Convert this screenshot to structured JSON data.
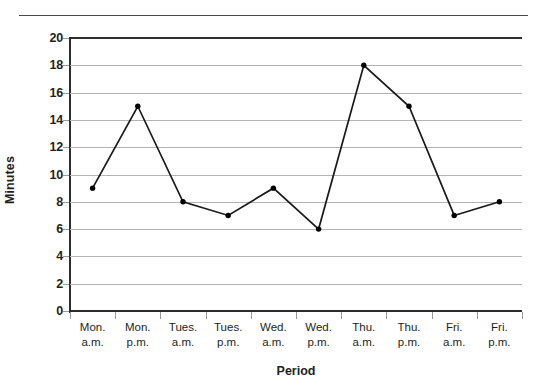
{
  "figure": {
    "top_rule": "decorative-rule"
  },
  "chart_data": {
    "type": "line",
    "title": "",
    "subtitle": "",
    "xlabel": "Period",
    "ylabel": "Minutes",
    "categories": [
      "Mon. a.m.",
      "Mon. p.m.",
      "Tues. a.m.",
      "Tues. p.m.",
      "Wed. a.m.",
      "Wed. p.m.",
      "Thu. a.m.",
      "Thu. p.m.",
      "Fri. a.m.",
      "Fri. p.m."
    ],
    "category_lines": [
      [
        "Mon.",
        "a.m."
      ],
      [
        "Mon.",
        "p.m."
      ],
      [
        "Tues.",
        "a.m."
      ],
      [
        "Tues.",
        "p.m."
      ],
      [
        "Wed.",
        "a.m."
      ],
      [
        "Wed.",
        "p.m."
      ],
      [
        "Thu.",
        "a.m."
      ],
      [
        "Thu.",
        "p.m."
      ],
      [
        "Fri.",
        "a.m."
      ],
      [
        "Fri.",
        "p.m."
      ]
    ],
    "values": [
      9,
      15,
      8,
      7,
      9,
      6,
      18,
      15,
      7,
      8
    ],
    "ylim": [
      0,
      20
    ],
    "ytick_labels": [
      "20",
      "18",
      "16",
      "14",
      "12",
      "10",
      "8",
      "6",
      "4",
      "2",
      "0"
    ],
    "ytick_values": [
      20,
      18,
      16,
      14,
      12,
      10,
      8,
      6,
      4,
      2,
      0
    ],
    "ytick_step": 2,
    "grid": true,
    "legend": false,
    "legend_position": "none",
    "marker": "filled-circle",
    "line_color": "#1a1a1a",
    "marker_color": "#000000",
    "grid_color": "#b4b4b4",
    "axis_color": "#2d2d2d",
    "background_color": "#ffffff"
  }
}
